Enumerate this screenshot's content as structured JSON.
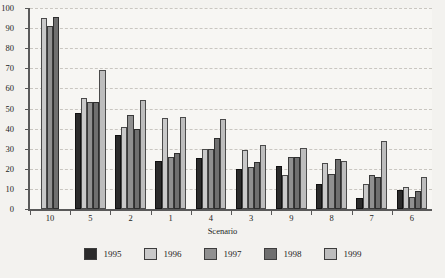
{
  "chart_data": {
    "type": "bar",
    "title": "",
    "xlabel": "Scenario",
    "ylabel": "",
    "ylim": [
      0,
      100
    ],
    "ytick_step": 10,
    "grid": true,
    "legend_position": "bottom",
    "categories": [
      "10",
      "5",
      "2",
      "1",
      "4",
      "3",
      "9",
      "8",
      "7",
      "6"
    ],
    "yticks": [
      "0",
      "10",
      "20",
      "30",
      "40",
      "50",
      "60",
      "70",
      "80",
      "90",
      "100"
    ],
    "series": [
      {
        "name": "1995",
        "color": "#2b2b2b",
        "values": [
          null,
          48,
          37,
          24,
          25.5,
          20,
          21.5,
          12.5,
          5.5,
          9.5
        ]
      },
      {
        "name": "1996",
        "color": "#c9c9c9",
        "values": [
          95,
          55,
          41,
          45.5,
          30,
          29.5,
          17,
          23,
          12.5,
          11
        ]
      },
      {
        "name": "1997",
        "color": "#909090",
        "values": [
          91,
          53,
          47,
          26,
          30,
          21,
          26,
          17.5,
          17,
          6
        ]
      },
      {
        "name": "1998",
        "color": "#6f6f6f",
        "values": [
          95.5,
          53,
          40,
          28,
          35.5,
          23.5,
          26,
          25,
          16,
          9
        ]
      },
      {
        "name": "1999",
        "color": "#bdbdbd",
        "values": [
          null,
          69,
          54,
          46,
          45,
          32,
          30.5,
          24,
          34,
          16
        ]
      }
    ]
  },
  "legend": {
    "items": [
      {
        "label": "1995",
        "swatch": "legend-swatch-1995"
      },
      {
        "label": "1996",
        "swatch": "legend-swatch-1996"
      },
      {
        "label": "1997",
        "swatch": "legend-swatch-1997"
      },
      {
        "label": "1998",
        "swatch": "legend-swatch-1998"
      },
      {
        "label": "1999",
        "swatch": "legend-swatch-1999"
      }
    ]
  }
}
